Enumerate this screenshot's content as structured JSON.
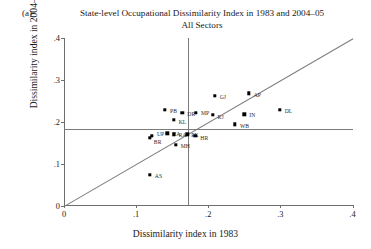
{
  "panel": {
    "tag": "(a)"
  },
  "title": {
    "line1": "State-level Occupational Dissimilarity Index in 1983 and 2004–05",
    "line2": "All Sectors"
  },
  "chart_data": {
    "type": "scatter",
    "xlabel": "Dissimilarity index in 1983",
    "ylabel": "Dissimilarity index in 2004–05",
    "xlim": [
      0,
      0.4
    ],
    "ylim": [
      0,
      0.4
    ],
    "xticks": [
      0,
      0.1,
      0.2,
      0.3,
      0.4
    ],
    "yticks": [
      0,
      0.1,
      0.2,
      0.3,
      0.4
    ],
    "xticklabels": [
      "0",
      ".1",
      ".2",
      ".3",
      ".4"
    ],
    "yticklabels": [
      "0",
      ".1",
      ".2",
      ".3",
      ".4"
    ],
    "grid": false,
    "legend": null,
    "reference_lines": [
      {
        "name": "mean-1983-vline",
        "orientation": "vertical",
        "value": 0.172
      },
      {
        "name": "mean-2004-hline",
        "orientation": "horizontal",
        "value": 0.182
      },
      {
        "name": "identity-line",
        "orientation": "diagonal",
        "from": [
          0,
          0
        ],
        "to": [
          0.4,
          0.4
        ]
      }
    ],
    "points": [
      {
        "label": "AS",
        "x": 0.119,
        "y": 0.073,
        "label_dx": 5,
        "label_dy": 1
      },
      {
        "label": "UP",
        "x": 0.122,
        "y": 0.166,
        "label_dx": 5,
        "label_dy": -2
      },
      {
        "label": "BR",
        "x": 0.119,
        "y": 0.162,
        "label_dx": 4,
        "label_dy": 4
      },
      {
        "label": "PB",
        "x": 0.14,
        "y": 0.228,
        "label_dx": 5,
        "label_dy": 1
      },
      {
        "label": "HA",
        "x": 0.143,
        "y": 0.172,
        "label_dx": 5,
        "label_dy": 1
      },
      {
        "label": "RA",
        "x": 0.152,
        "y": 0.17,
        "label_dx": 5,
        "label_dy": 1
      },
      {
        "label": "KL",
        "x": 0.152,
        "y": 0.205,
        "label_dx": 5,
        "label_dy": 2
      },
      {
        "label": "MH",
        "x": 0.155,
        "y": 0.145,
        "label_dx": 5,
        "label_dy": 1
      },
      {
        "label": "DR",
        "x": 0.164,
        "y": 0.222,
        "label_dx": 5,
        "label_dy": 1
      },
      {
        "label": "PK",
        "x": 0.171,
        "y": 0.17,
        "label_dx": 4,
        "label_dy": 1
      },
      {
        "label": "HR",
        "x": 0.182,
        "y": 0.166,
        "label_dx": 5,
        "label_dy": 2
      },
      {
        "label": "MP",
        "x": 0.183,
        "y": 0.221,
        "label_dx": 5,
        "label_dy": 0
      },
      {
        "label": "RJ",
        "x": 0.206,
        "y": 0.216,
        "label_dx": 5,
        "label_dy": 2
      },
      {
        "label": "GJ",
        "x": 0.209,
        "y": 0.262,
        "label_dx": 5,
        "label_dy": 1
      },
      {
        "label": "WB",
        "x": 0.237,
        "y": 0.194,
        "label_dx": 5,
        "label_dy": 2
      },
      {
        "label": "IN",
        "x": 0.25,
        "y": 0.218,
        "label_dx": 5,
        "label_dy": 1
      },
      {
        "label": "AP",
        "x": 0.256,
        "y": 0.268,
        "label_dx": 5,
        "label_dy": 2
      },
      {
        "label": "DL",
        "x": 0.299,
        "y": 0.228,
        "label_dx": 5,
        "label_dy": 1
      }
    ]
  }
}
